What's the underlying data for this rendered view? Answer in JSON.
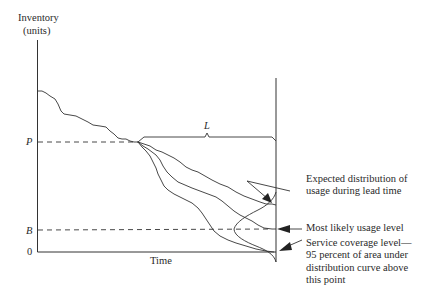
{
  "diagram": {
    "y_axis_label_line1": "Inventory",
    "y_axis_label_line2": "(units)",
    "x_axis_label": "Time",
    "tick_P": "P",
    "tick_B": "B",
    "tick_0": "0",
    "lead_time_label": "L",
    "annotations": {
      "expected_distribution_line1": "Expected distribution of",
      "expected_distribution_line2": "usage during lead time",
      "most_likely": "Most likely usage level",
      "service_coverage_line1": "Service coverage level—",
      "service_coverage_line2": "95 percent of area under",
      "service_coverage_line3": "distribution curve above",
      "service_coverage_line4": "this point"
    },
    "colors": {
      "line": "#333333",
      "text": "#2a2a2a",
      "background": "#ffffff"
    }
  }
}
